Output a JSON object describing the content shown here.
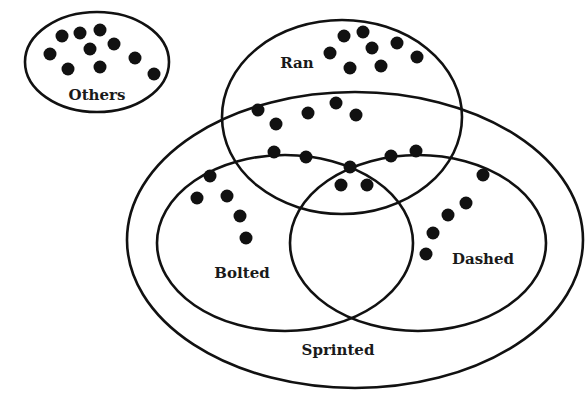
{
  "diagram": {
    "type": "venn",
    "colors": {
      "stroke": "#111111",
      "dot": "#111111",
      "label": "#1a1a1a",
      "background": "#ffffff"
    },
    "sets": [
      {
        "id": "others",
        "label": "Others",
        "cx": 97,
        "cy": 62,
        "rx": 72,
        "ry": 50,
        "label_x": 97,
        "label_y": 100
      },
      {
        "id": "ran",
        "label": "Ran",
        "cx": 342,
        "cy": 117,
        "rx": 120,
        "ry": 97,
        "label_x": 297,
        "label_y": 68
      },
      {
        "id": "sprinted",
        "label": "Sprinted",
        "cx": 355,
        "cy": 240,
        "rx": 228,
        "ry": 148,
        "label_x": 338,
        "label_y": 355
      },
      {
        "id": "bolted",
        "label": "Bolted",
        "cx": 285,
        "cy": 243,
        "rx": 128,
        "ry": 88,
        "label_x": 242,
        "label_y": 278
      },
      {
        "id": "dashed",
        "label": "Dashed",
        "cx": 418,
        "cy": 243,
        "rx": 128,
        "ry": 88,
        "label_x": 483,
        "label_y": 264
      }
    ],
    "regions": [
      {
        "name": "others",
        "count": 10,
        "dots": [
          [
            62,
            36
          ],
          [
            80,
            33
          ],
          [
            100,
            30
          ],
          [
            50,
            54
          ],
          [
            90,
            49
          ],
          [
            114,
            44
          ],
          [
            68,
            69
          ],
          [
            100,
            67
          ],
          [
            135,
            58
          ],
          [
            154,
            74
          ]
        ]
      },
      {
        "name": "ran-only",
        "count": 8,
        "dots": [
          [
            344,
            36
          ],
          [
            363,
            32
          ],
          [
            330,
            53
          ],
          [
            372,
            48
          ],
          [
            397,
            43
          ],
          [
            350,
            68
          ],
          [
            381,
            66
          ],
          [
            417,
            57
          ]
        ]
      },
      {
        "name": "ran-and-sprinted",
        "count": 5,
        "dots": [
          [
            258,
            110
          ],
          [
            276,
            124
          ],
          [
            308,
            113
          ],
          [
            336,
            103
          ],
          [
            356,
            115
          ]
        ]
      },
      {
        "name": "ran-and-bolted",
        "count": 2,
        "dots": [
          [
            274,
            152
          ],
          [
            306,
            157
          ]
        ]
      },
      {
        "name": "ran-bolted-dashed",
        "count": 3,
        "dots": [
          [
            350,
            167
          ],
          [
            341,
            185
          ],
          [
            367,
            185
          ]
        ]
      },
      {
        "name": "ran-and-dashed",
        "count": 2,
        "dots": [
          [
            391,
            156
          ],
          [
            416,
            151
          ]
        ]
      },
      {
        "name": "bolted-only",
        "count": 5,
        "dots": [
          [
            210,
            176
          ],
          [
            197,
            198
          ],
          [
            227,
            196
          ],
          [
            240,
            216
          ],
          [
            246,
            238
          ]
        ]
      },
      {
        "name": "dashed-only",
        "count": 5,
        "dots": [
          [
            483,
            175
          ],
          [
            466,
            203
          ],
          [
            448,
            215
          ],
          [
            433,
            233
          ],
          [
            426,
            254
          ]
        ]
      },
      {
        "name": "bolted-and-dashed-only",
        "count": 0,
        "dots": []
      },
      {
        "name": "sprinted-only",
        "count": 0,
        "dots": []
      }
    ]
  }
}
